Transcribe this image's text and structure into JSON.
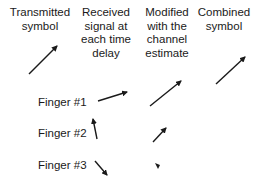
{
  "headers": {
    "transmitted": "Transmitted\nsymbol",
    "received": "Received\nsignal at\neach time\ndelay",
    "modified": "Modified\nwith the\nchannel\nestimate",
    "combined": "Combined\nsymbol"
  },
  "fingers": [
    {
      "label": "Finger #1"
    },
    {
      "label": "Finger #2"
    },
    {
      "label": "Finger #3"
    }
  ],
  "arrow_color": "#1a1a1a"
}
